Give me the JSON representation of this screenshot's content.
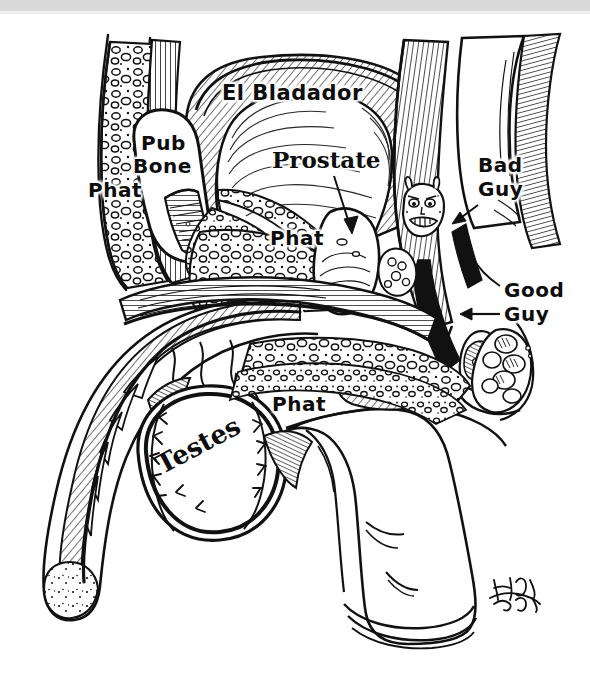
{
  "figure": {
    "type": "hand-drawn anatomical cross-section cartoon",
    "medium": "pen and ink line drawing on white paper",
    "background_color": "#ffffff",
    "ink_color": "#0d0d0d",
    "scan_edge_color": "#d9d9d9"
  },
  "labels": {
    "el_bladador": "El Bladador",
    "prostate": "Prostate",
    "pub": "Pub",
    "bone": "Bone",
    "phat_upper_left": "Phat",
    "phat_center": "Phat",
    "phat_lower": "Phat",
    "bad": "Bad",
    "bad_guy": "Guy",
    "good": "Good",
    "good_guy": "Guy",
    "testes": "Testes"
  },
  "annotations": [
    {
      "name": "prostate-arrow",
      "label": "Prostate",
      "from": [
        338,
        178
      ],
      "to": [
        352,
        232
      ],
      "direction": "down-right"
    },
    {
      "name": "bad-guy-arrow",
      "label": "Bad Guy",
      "from": [
        475,
        208
      ],
      "to": [
        455,
        223
      ],
      "direction": "down-left"
    },
    {
      "name": "good-guy-arrow",
      "label": "Good Guy",
      "from": [
        500,
        315
      ],
      "to": [
        462,
        315
      ],
      "direction": "left"
    }
  ],
  "features": [
    {
      "name": "bladder",
      "label": "El Bladador",
      "note": "large hatched dome, upper center"
    },
    {
      "name": "prostate",
      "label": "Prostate",
      "note": "pale gland below bladder, bold serif label"
    },
    {
      "name": "pubic-bone",
      "label": "Pub Bone",
      "note": "cut bone with marrow hatching, upper left"
    },
    {
      "name": "fat-tissue",
      "label": "Phat",
      "note": "stippled/pebbled adipose regions, three labels"
    },
    {
      "name": "bad-guy-face",
      "label": "Bad Guy",
      "note": "small devil cartoon face with horns at prostate edge"
    },
    {
      "name": "good-guy",
      "label": "Good Guy",
      "note": "structure right of the rectum, arrow pointing left"
    },
    {
      "name": "testis",
      "label": "Testes",
      "note": "drawn as a baseball with stitching, lower center-left"
    },
    {
      "name": "penis-shaft",
      "label": "",
      "note": "long curved shaft to the left with corpus hatching"
    },
    {
      "name": "glans-and-foreskin",
      "label": "",
      "note": "lower center-right, rolled rim"
    },
    {
      "name": "signature",
      "label": "",
      "note": "artist signature scribble, lower right"
    }
  ],
  "signature": {
    "present": true,
    "position": [
      500,
      590
    ]
  }
}
